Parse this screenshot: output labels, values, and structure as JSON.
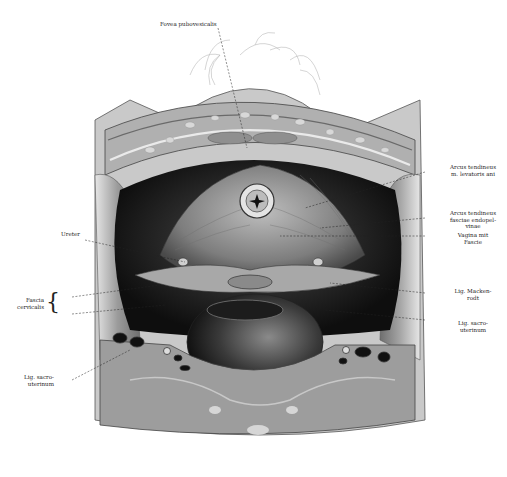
{
  "figure": {
    "type": "anatomical-illustration",
    "view": "pelvic floor viewed from above (bladder removed), showing uterine cervix, vagina and ligaments",
    "colors": {
      "background": "#ffffff",
      "ink": "#222222",
      "tissue_light": "#d8d8d8",
      "tissue_mid": "#9a9a9a",
      "tissue_dark": "#3a3a3a",
      "cavity": "#151515"
    }
  },
  "labels": {
    "top": [
      {
        "id": "fovea",
        "text": "Fovea pubovesicalis"
      }
    ],
    "left": [
      {
        "id": "ureter",
        "text": "Ureter"
      },
      {
        "id": "fascia-cervicalis",
        "line1": "Fascia",
        "line2": "cervicalis"
      },
      {
        "id": "lig-sacro-left",
        "line1": "Lig. sacro-",
        "line2": "uterinum"
      }
    ],
    "right": [
      {
        "id": "arcus-levator",
        "line1": "Arcus tendineus",
        "line2": "m. levatoris ani"
      },
      {
        "id": "arcus-fasciae",
        "line1": "Arcus tendineus",
        "line2": "fasciae endopel-",
        "line3": "vinae"
      },
      {
        "id": "vagina",
        "line1": "Vagina mit",
        "line2": "Fascie"
      },
      {
        "id": "lig-mackenrodt",
        "line1": "Lig. Macken-",
        "line2": "rodt"
      },
      {
        "id": "lig-sacro-right",
        "line1": "Lig. sacro-",
        "line2": "uterinum"
      }
    ]
  }
}
